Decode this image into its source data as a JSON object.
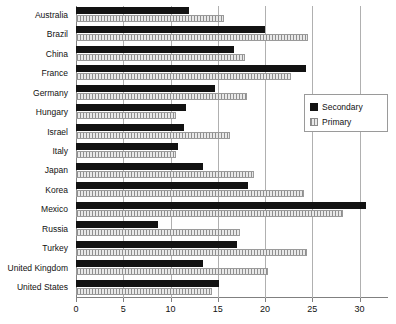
{
  "chart_data": {
    "type": "bar",
    "orientation": "horizontal",
    "title": "",
    "xlabel": "",
    "ylabel": "",
    "xlim": [
      0,
      33
    ],
    "xticks": [
      0,
      5,
      10,
      15,
      20,
      25,
      30
    ],
    "grid": true,
    "legend_position": "right-middle",
    "categories": [
      "Australia",
      "Brazil",
      "China",
      "France",
      "Germany",
      "Hungary",
      "Israel",
      "Italy",
      "Japan",
      "Korea",
      "Mexico",
      "Russia",
      "Turkey",
      "United Kingdom",
      "United States"
    ],
    "series": [
      {
        "name": "Secondary",
        "color": "#121212",
        "values": [
          12.0,
          20.0,
          16.7,
          24.3,
          14.7,
          11.6,
          11.4,
          10.8,
          13.4,
          18.2,
          30.7,
          8.7,
          17.0,
          13.4,
          15.1
        ]
      },
      {
        "name": "Primary",
        "color": "#d9d9d9",
        "values": [
          15.7,
          24.5,
          17.9,
          22.7,
          18.1,
          10.6,
          16.3,
          10.6,
          18.8,
          24.1,
          28.2,
          17.3,
          24.4,
          20.3,
          14.4
        ]
      }
    ]
  },
  "legend": {
    "items": [
      {
        "label": "Secondary",
        "swatch": "solid-black-square"
      },
      {
        "label": "Primary",
        "swatch": "hatched-light-square"
      }
    ]
  }
}
